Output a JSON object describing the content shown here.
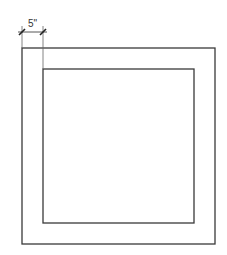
{
  "diagram": {
    "type": "frame-dimension-drawing",
    "dimension_label": "5\"",
    "colors": {
      "background": "#ffffff",
      "line": "#3a3a3a"
    },
    "outer_rect": {
      "x": 22,
      "y": 48,
      "width": 193,
      "height": 196
    },
    "inner_rect": {
      "x": 43,
      "y": 69,
      "width": 151,
      "height": 154
    },
    "dimension": {
      "from_x": 22,
      "to_x": 43,
      "line_y": 32
    }
  }
}
